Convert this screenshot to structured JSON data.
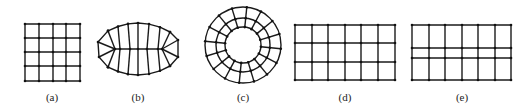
{
  "figure": {
    "panels": [
      {
        "id": "a",
        "label": "(a)",
        "description": "Uniform square mesh, 4x4 cells",
        "label_x": 52
      },
      {
        "id": "b",
        "label": "(b)",
        "description": "Lens/eye-shaped structured mesh with converging ends",
        "label_x": 138
      },
      {
        "id": "c",
        "label": "(c)",
        "description": "Annular (ring) mesh with radial spokes",
        "label_x": 243
      },
      {
        "id": "d",
        "label": "(d)",
        "description": "Rectangular mesh, 6x3 cells, uniform rows",
        "label_x": 345
      },
      {
        "id": "e",
        "label": "(e)",
        "description": "Rectangular mesh, 6x3 cells, non-uniform rows (narrow middle row)",
        "label_x": 462
      }
    ],
    "colors": {
      "line": "#1a1a1a",
      "node": "#111111",
      "background": "#ffffff"
    }
  }
}
